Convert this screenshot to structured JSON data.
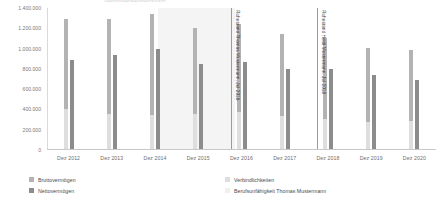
{
  "chart_data": {
    "type": "bar",
    "title": "Vermögensentwicklung",
    "xlabel": "",
    "ylabel": "",
    "ylim": [
      0,
      1400000
    ],
    "ytick_step": 200000,
    "ytick_labels": [
      "1.400.000",
      "1.200.000",
      "1.000.000",
      "800.000",
      "600.000",
      "400.000",
      "200.000",
      "0"
    ],
    "ytick_values": [
      1400000,
      1200000,
      1000000,
      800000,
      600000,
      400000,
      200000,
      0
    ],
    "grid": false,
    "legend_position": "bottom",
    "categories": [
      "Dez 2012",
      "Dez 2013",
      "Dez 2014",
      "Dez 2015",
      "Dez 2016",
      "Dez 2017",
      "Dez 2018",
      "Dez 2019",
      "Dez 2020"
    ],
    "series": [
      {
        "name": "Bruttovermögen",
        "color": "#b3b3b3",
        "values": [
          1290000,
          1290000,
          1345000,
          1200000,
          1240000,
          1140000,
          1105000,
          1010000,
          985000
        ]
      },
      {
        "name": "Nettovermögen",
        "color": "#8c8c8c",
        "values": [
          890000,
          935000,
          1000000,
          845000,
          865000,
          800000,
          795000,
          735000,
          695000
        ]
      }
    ],
    "overlay_series": [
      {
        "name": "Verbindlichkeiten",
        "color": "#dedede",
        "values": [
          400000,
          355000,
          345000,
          355000,
          375000,
          340000,
          310000,
          275000,
          290000
        ]
      }
    ],
    "bands": [
      {
        "name": "Berufsunfähigkeit Thomas Mustermann",
        "color": "#f4f4f4",
        "start_category": "Dez 2014",
        "end_category": "Dez 2016"
      }
    ],
    "annotations": [
      {
        "label": "Ruhestand Thomas Mustermann, Jul 2016",
        "at_category": "Dez 2016",
        "color": "#9a9a9a"
      },
      {
        "label": "Ruhestand Heidi Mustermann, Jul 2018",
        "at_category": "Dez 2018",
        "color": "#9a9a9a"
      }
    ]
  },
  "legend": {
    "column_left": [
      {
        "label": "Bruttovermögen",
        "color": "#b3b3b3"
      },
      {
        "label": "Nettovermögen",
        "color": "#8c8c8c"
      }
    ],
    "column_right": [
      {
        "label": "Verbindlichkeiten",
        "color": "#dedede"
      },
      {
        "label": "Berufsunfähigkeit Thomas Mustermann",
        "color": "#f0f0f0"
      }
    ]
  }
}
